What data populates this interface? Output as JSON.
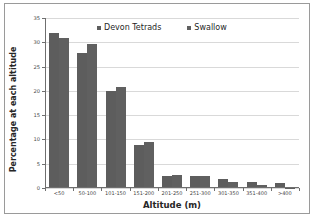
{
  "chart_data": {
    "type": "bar",
    "title": "",
    "xlabel": "Altitude (m)",
    "ylabel": "Percentage at each altitude",
    "categories": [
      "<50",
      "50-100",
      "101-150",
      "151-200",
      "201-250",
      "251-300",
      "301-350",
      "351-400",
      ">400"
    ],
    "series": [
      {
        "name": "Devon Tetrads",
        "color": "#5d5d5d",
        "values": [
          32.0,
          27.7,
          19.9,
          8.9,
          2.5,
          2.4,
          1.9,
          1.3,
          1.0
        ]
      },
      {
        "name": "Swallow",
        "color": "#606060",
        "values": [
          30.8,
          29.6,
          20.7,
          9.5,
          2.7,
          2.4,
          1.2,
          0.6,
          0.05
        ]
      }
    ],
    "ylim": [
      0,
      35
    ],
    "yticks": [
      0,
      5,
      10,
      15,
      20,
      25,
      30,
      35
    ],
    "ytick_labels": [
      "0",
      "5",
      "10",
      "15",
      "20",
      "25",
      "30",
      "35"
    ],
    "grid": true,
    "legend_position": "top-center"
  },
  "legend": {
    "items": [
      {
        "label": "Devon Tetrads"
      },
      {
        "label": "Swallow"
      }
    ]
  }
}
